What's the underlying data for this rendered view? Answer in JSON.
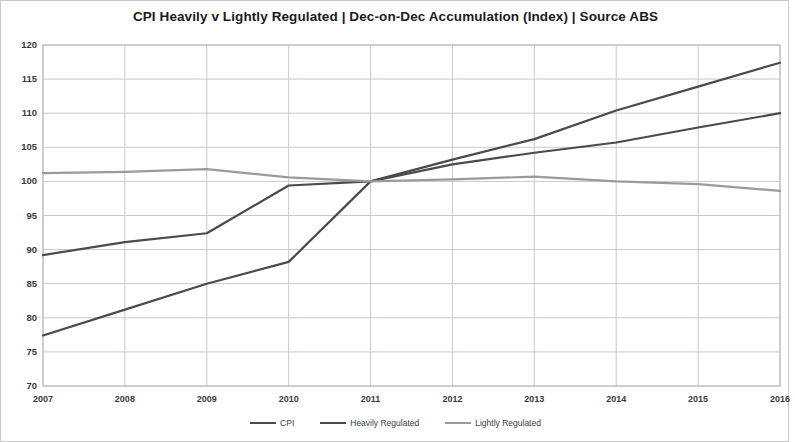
{
  "chart_data": {
    "type": "line",
    "title": "CPI Heavily v Lightly Regulated | Dec-on-Dec Accumulation (Index) | Source ABS",
    "xlabel": "",
    "ylabel": "",
    "x": [
      2007,
      2008,
      2009,
      2010,
      2011,
      2012,
      2013,
      2014,
      2015,
      2016
    ],
    "xtick_labels": [
      "2007",
      "2008",
      "2009",
      "2010",
      "2011",
      "2012",
      "2013",
      "2014",
      "2015",
      "2016"
    ],
    "ytick_labels": [
      "70",
      "75",
      "80",
      "85",
      "90",
      "95",
      "100",
      "105",
      "110",
      "115",
      "120"
    ],
    "yticks": [
      70,
      75,
      80,
      85,
      90,
      95,
      100,
      105,
      110,
      115,
      120
    ],
    "ylim": [
      70,
      120
    ],
    "xlim": [
      2007,
      2016
    ],
    "grid": true,
    "legend_position": "bottom",
    "series": [
      {
        "name": "CPI",
        "color": "#4a4a4a",
        "values": [
          77.4,
          81.2,
          85.0,
          88.2,
          100.0,
          103.2,
          106.2,
          110.4,
          113.9,
          117.4
        ]
      },
      {
        "name": "Heavily Regulated",
        "color": "#4a4a4a",
        "values": [
          89.2,
          91.1,
          92.4,
          99.4,
          100.0,
          102.5,
          104.2,
          105.7,
          107.9,
          110.0
        ]
      },
      {
        "name": "Lightly Regulated",
        "color": "#9a9a9a",
        "values": [
          101.2,
          101.4,
          101.8,
          100.6,
          100.0,
          100.3,
          100.7,
          100.0,
          99.6,
          98.6
        ]
      }
    ]
  },
  "legend": {
    "entries": [
      {
        "label": "CPI"
      },
      {
        "label": "Heavily Regulated"
      },
      {
        "label": "Lightly Regulated"
      }
    ]
  },
  "colors": {
    "frame": "#b8b8b8",
    "grid": "#c8c8d2",
    "dark_line": "#4a4a4a",
    "light_line": "#9a9a9a",
    "text": "#3a3a3a",
    "title": "#1b1b1b"
  }
}
